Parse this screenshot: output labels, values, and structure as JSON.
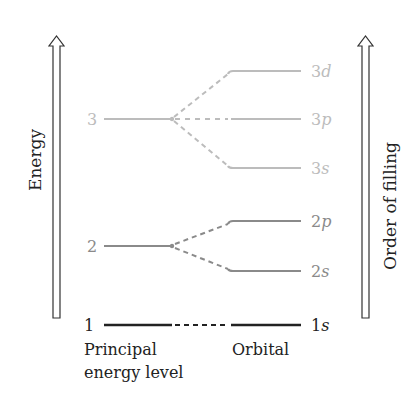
{
  "axes": {
    "left_label": "Energy",
    "right_label": "Order of filling"
  },
  "colors": {
    "level1": "#222222",
    "level2": "#8a8a8a",
    "level3": "#bcbcbc"
  },
  "levels": [
    {
      "n": "1",
      "orbitals": [
        "1s"
      ]
    },
    {
      "n": "2",
      "orbitals": [
        "2s",
        "2p"
      ]
    },
    {
      "n": "3",
      "orbitals": [
        "3s",
        "3p",
        "3d"
      ]
    }
  ],
  "labels": {
    "level_1": "1",
    "level_2": "2",
    "level_3": "3",
    "orb_1s_num": "1",
    "orb_1s_let": "s",
    "orb_2s_num": "2",
    "orb_2s_let": "s",
    "orb_2p_num": "2",
    "orb_2p_let": "p",
    "orb_3s_num": "3",
    "orb_3s_let": "s",
    "orb_3p_num": "3",
    "orb_3p_let": "p",
    "orb_3d_num": "3",
    "orb_3d_let": "d"
  },
  "footer": {
    "principal_line1": "Principal",
    "principal_line2": "energy level",
    "orbital": "Orbital"
  }
}
